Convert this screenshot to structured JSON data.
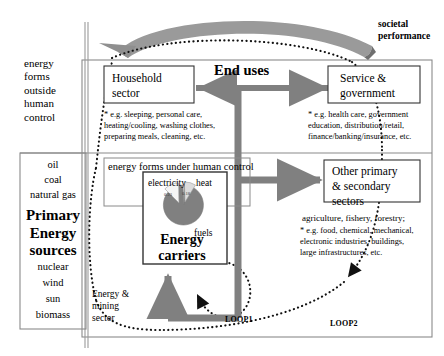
{
  "figure": {
    "title_hidden": "",
    "societal_performance_label": "societal\nperformance",
    "end_uses_label": "End uses"
  },
  "left_column": {
    "outside_control_label": "energy\nforms\noutside\nhuman\ncontrol",
    "primary_box": {
      "top_items": [
        "oil",
        "coal",
        "natural gas"
      ],
      "heading": "Primary\nEnergy\nsources",
      "bottom_items": [
        "nuclear",
        "wind",
        "sun",
        "biomass"
      ]
    }
  },
  "human_control": {
    "label": "energy forms under human control"
  },
  "sectors": [
    {
      "id": "household",
      "title": "Household\nsector",
      "note": "* e.g. sleeping, personal care,\n   heating/cooling, washing clothes,\n   preparing meals, cleaning, etc."
    },
    {
      "id": "service-government",
      "title": "Service &\ngovernment",
      "note": "* e.g. health care, government\n   education, distribution/retail,\n   finance/banking/insurance, etc."
    },
    {
      "id": "other-primary-secondary",
      "title": "Other primary\n& secondary\nsectors",
      "note_heading": "agriculture, fishery, forestry;",
      "note": "* e.g. food, chemical, mechanical,\n   electronic industries, buildings,\n   large infrastructures, etc."
    }
  ],
  "energy_carriers": {
    "title": "Energy\ncarriers",
    "slice_labels": {
      "electricity": "electricity",
      "heat": "heat",
      "fuels": "fuels"
    }
  },
  "energy_mining_sector": {
    "label": "Energy &\nmining\nsector"
  },
  "loops": [
    {
      "id": "loop1",
      "label": "LOOP1"
    },
    {
      "id": "loop2",
      "label": "LOOP2"
    }
  ],
  "chart_data": {
    "type": "pie",
    "categories": [
      "electricity",
      "heat",
      "fuels"
    ],
    "values": [
      0.23,
      0.18,
      0.59
    ],
    "data_labels": [
      "0.23",
      "0.18",
      ""
    ],
    "colors": [
      "#f2f2f2",
      "#d9d9d9",
      "#808080"
    ],
    "legend": "inline-labels",
    "grid": false
  },
  "colors": {
    "gray_arrow": "#808080",
    "band_gray": "#9a9a9a",
    "slice_fuels": "#808080",
    "slice_heat": "#d9d9d9",
    "slice_electricity": "#f2f2f2",
    "frame": "#808080",
    "ink": "#000000"
  }
}
